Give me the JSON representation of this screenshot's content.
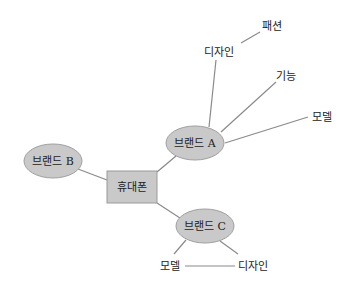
{
  "diagram": {
    "type": "mind-map",
    "colors": {
      "node_fill": "#c9c9c9",
      "node_stroke": "#9a9a9a",
      "edge": "#8a8a8a",
      "text": "#222222"
    },
    "center": {
      "label": "휴대폰"
    },
    "brands": [
      {
        "id": "a",
        "label": "브랜드 A",
        "attributes": [
          {
            "label": "디자인",
            "children": [
              {
                "label": "패션"
              }
            ]
          },
          {
            "label": "기능"
          },
          {
            "label": "모델"
          }
        ]
      },
      {
        "id": "b",
        "label": "브랜드 B",
        "attributes": []
      },
      {
        "id": "c",
        "label": "브랜드 C",
        "attributes": [
          {
            "label": "모델"
          },
          {
            "label": "디자인"
          }
        ]
      }
    ]
  }
}
